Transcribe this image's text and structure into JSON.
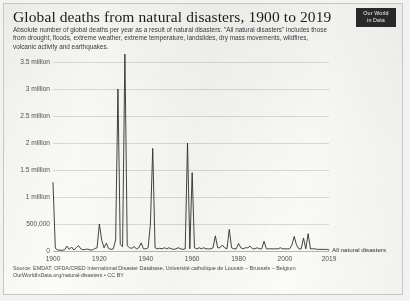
{
  "header": {
    "title": "Global deaths from natural disasters, 1900 to 2019",
    "subtitle": "Absolute number of global deaths per year as a result of natural disasters. \"All natural disasters\" includes those from drought, floods, extreme weather, extreme temperature, landslides, dry mass movements, wildfires, volcanic activity and earthquakes.",
    "logo_line1": "Our World",
    "logo_line2": "in Data"
  },
  "footer": {
    "source_line1": "Source: EMDAT: OFDA/CRED International Disaster Database, Université catholique de Louvain – Brussels – Belgium",
    "source_line2": "OurWorldInData.org/natural-disasters • CC BY"
  },
  "colors": {
    "line": "#2f2f2d",
    "grid": "#dcdad6",
    "axis": "#b9b7b3",
    "text": "#1d1d1b",
    "muted": "#555452",
    "logo_bg": "#2b2b2b",
    "paper": "#fbfbfa"
  },
  "chart_data": {
    "type": "line",
    "title": "Global deaths from natural disasters, 1900 to 2019",
    "xlabel": "",
    "ylabel": "",
    "xlim": [
      1900,
      2019
    ],
    "ylim": [
      0,
      3500000
    ],
    "grid": true,
    "legend_position": "right-inline",
    "ytick_values": [
      0,
      500000,
      1000000,
      1500000,
      2000000,
      2500000,
      3000000,
      3500000
    ],
    "ytick_labels": [
      "0",
      "500,000",
      "1 million",
      "1.5 million",
      "2 million",
      "2.5 million",
      "3 million",
      "3.5 million"
    ],
    "xtick_values": [
      1900,
      1920,
      1940,
      1960,
      1980,
      2000,
      2019
    ],
    "xtick_labels": [
      "1900",
      "1920",
      "1940",
      "1960",
      "1980",
      "2000",
      "2019"
    ],
    "series": [
      {
        "name": "All natural disasters",
        "x": [
          1900,
          1901,
          1902,
          1903,
          1904,
          1905,
          1906,
          1907,
          1908,
          1909,
          1910,
          1911,
          1912,
          1913,
          1914,
          1915,
          1916,
          1917,
          1918,
          1919,
          1920,
          1921,
          1922,
          1923,
          1924,
          1925,
          1926,
          1927,
          1928,
          1929,
          1930,
          1931,
          1932,
          1933,
          1934,
          1935,
          1936,
          1937,
          1938,
          1939,
          1940,
          1941,
          1942,
          1943,
          1944,
          1945,
          1946,
          1947,
          1948,
          1949,
          1950,
          1951,
          1952,
          1953,
          1954,
          1955,
          1956,
          1957,
          1958,
          1959,
          1960,
          1961,
          1962,
          1963,
          1964,
          1965,
          1966,
          1967,
          1968,
          1969,
          1970,
          1971,
          1972,
          1973,
          1974,
          1975,
          1976,
          1977,
          1978,
          1979,
          1980,
          1981,
          1982,
          1983,
          1984,
          1985,
          1986,
          1987,
          1988,
          1989,
          1990,
          1991,
          1992,
          1993,
          1994,
          1995,
          1996,
          1997,
          1998,
          1999,
          2000,
          2001,
          2002,
          2003,
          2004,
          2005,
          2006,
          2007,
          2008,
          2009,
          2010,
          2011,
          2012,
          2013,
          2014,
          2015,
          2016,
          2017,
          2018,
          2019
        ],
        "values": [
          1267000,
          50000,
          20000,
          15000,
          12000,
          25000,
          90000,
          30000,
          75000,
          18000,
          60000,
          100000,
          40000,
          22000,
          30000,
          35000,
          20000,
          18000,
          45000,
          60000,
          500000,
          200000,
          60000,
          145000,
          45000,
          30000,
          40000,
          205000,
          3000000,
          120000,
          80000,
          3700000,
          100000,
          60000,
          50000,
          80000,
          40000,
          60000,
          150000,
          40000,
          40000,
          60000,
          500000,
          1900000,
          60000,
          40000,
          50000,
          40000,
          60000,
          40000,
          60000,
          40000,
          30000,
          40000,
          60000,
          40000,
          30000,
          40000,
          2000000,
          40000,
          1450000,
          60000,
          40000,
          60000,
          40000,
          60000,
          40000,
          40000,
          40000,
          60000,
          280000,
          60000,
          60000,
          110000,
          60000,
          40000,
          400000,
          60000,
          40000,
          40000,
          140000,
          60000,
          40000,
          60000,
          60000,
          90000,
          40000,
          40000,
          60000,
          40000,
          40000,
          180000,
          40000,
          40000,
          40000,
          40000,
          40000,
          40000,
          60000,
          40000,
          40000,
          40000,
          40000,
          110000,
          270000,
          110000,
          40000,
          40000,
          240000,
          40000,
          320000,
          40000,
          40000,
          40000,
          30000,
          30000,
          30000,
          30000,
          30000,
          20000
        ]
      }
    ]
  }
}
